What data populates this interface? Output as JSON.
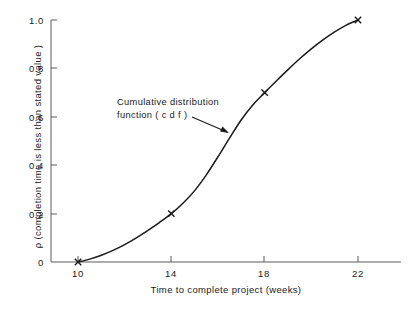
{
  "chart_data": {
    "type": "line",
    "title": "",
    "subtitle": "",
    "xlabel": "Time to complete project (weeks)",
    "ylabel": "ρ (completion time is less than stated value )",
    "xlim": [
      10,
      23.5
    ],
    "ylim": [
      0,
      1.0
    ],
    "grid": false,
    "legend_position": "none",
    "x_ticks": [
      {
        "value": 10,
        "label": "10"
      },
      {
        "value": 14,
        "label": "14"
      },
      {
        "value": 18,
        "label": "18"
      },
      {
        "value": 22,
        "label": "22"
      }
    ],
    "y_ticks": [
      {
        "value": 0,
        "label": "0"
      },
      {
        "value": 0.2,
        "label": "0.2"
      },
      {
        "value": 0.4,
        "label": "0.4"
      },
      {
        "value": 0.6,
        "label": "0.6"
      },
      {
        "value": 0.8,
        "label": "0.8"
      },
      {
        "value": 1.0,
        "label": "1.0"
      }
    ],
    "series": [
      {
        "name": "Cumulative distribution function (c d f )",
        "marker": "x",
        "line_color": "#1a1a1a",
        "x": [
          10,
          14,
          18,
          22
        ],
        "y": [
          0.0,
          0.2,
          0.7,
          1.0
        ],
        "marked_points": [
          {
            "x": 10,
            "y": 0.0
          },
          {
            "x": 14,
            "y": 0.2
          },
          {
            "x": 18,
            "y": 0.7
          },
          {
            "x": 22,
            "y": 1.0
          }
        ],
        "curve_points": [
          {
            "x": 10.0,
            "y": 0.0
          },
          {
            "x": 10.5,
            "y": 0.012
          },
          {
            "x": 11.0,
            "y": 0.028
          },
          {
            "x": 11.5,
            "y": 0.048
          },
          {
            "x": 12.0,
            "y": 0.072
          },
          {
            "x": 12.5,
            "y": 0.1
          },
          {
            "x": 13.0,
            "y": 0.131
          },
          {
            "x": 13.5,
            "y": 0.164
          },
          {
            "x": 14.0,
            "y": 0.2
          },
          {
            "x": 14.5,
            "y": 0.243
          },
          {
            "x": 15.0,
            "y": 0.295
          },
          {
            "x": 15.5,
            "y": 0.36
          },
          {
            "x": 16.0,
            "y": 0.435
          },
          {
            "x": 16.5,
            "y": 0.513
          },
          {
            "x": 17.0,
            "y": 0.588
          },
          {
            "x": 17.5,
            "y": 0.65
          },
          {
            "x": 18.0,
            "y": 0.7
          },
          {
            "x": 18.5,
            "y": 0.748
          },
          {
            "x": 19.0,
            "y": 0.795
          },
          {
            "x": 19.5,
            "y": 0.84
          },
          {
            "x": 20.0,
            "y": 0.881
          },
          {
            "x": 20.5,
            "y": 0.918
          },
          {
            "x": 21.0,
            "y": 0.951
          },
          {
            "x": 21.5,
            "y": 0.979
          },
          {
            "x": 22.0,
            "y": 1.0
          }
        ]
      }
    ],
    "annotations": [
      {
        "name": "cdf-callout",
        "line1": "Cumulative distribution",
        "line2": "function ( c d f )",
        "arrow_from": {
          "x_px": 192,
          "y_px": 117
        },
        "arrow_to": {
          "x_px": 229,
          "y_px": 133
        }
      }
    ],
    "colors": {
      "line": "#1a1a1a",
      "axis": "#555555",
      "text": "#1a1a1a",
      "background": "#ffffff"
    }
  }
}
